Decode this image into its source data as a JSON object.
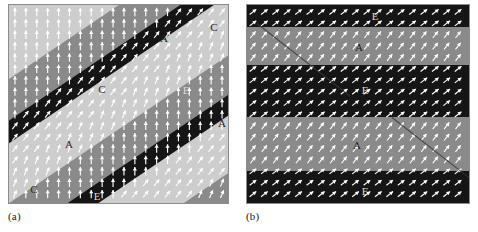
{
  "figure": {
    "type": "vector-field-domain-map",
    "background_color": "#ffffff",
    "panels": [
      {
        "id": "a",
        "caption": "(a)",
        "band_orientation": "diagonal",
        "band_angle_deg": -34,
        "arrow_color": "#ffffff",
        "frame_color": "#8c8c8c",
        "domains": [
          {
            "label": "C",
            "shade": "light",
            "color": "#cdcdcd"
          },
          {
            "label": "A",
            "shade": "mid",
            "color": "#8a8a8a"
          },
          {
            "label": "E",
            "shade": "dark",
            "color": "#151515"
          }
        ],
        "labels": [
          {
            "text": "C",
            "x": 205,
            "y": 22,
            "on": "light"
          },
          {
            "text": "A",
            "x": 155,
            "y": 33,
            "on": "mid"
          },
          {
            "text": "E",
            "x": 177,
            "y": 85,
            "on": "dark"
          },
          {
            "text": "C",
            "x": 93,
            "y": 84,
            "on": "light"
          },
          {
            "text": "A",
            "x": 213,
            "y": 118,
            "on": "mid"
          },
          {
            "text": "A",
            "x": 60,
            "y": 139,
            "on": "mid"
          },
          {
            "text": "C",
            "x": 25,
            "y": 184,
            "on": "light"
          },
          {
            "text": "E",
            "x": 88,
            "y": 191,
            "on": "dark"
          }
        ]
      },
      {
        "id": "b",
        "caption": "(b)",
        "band_orientation": "horizontal",
        "band_angle_deg": 0,
        "arrow_color": "#ffffff",
        "frame_color": "#8c8c8c",
        "domains": [
          {
            "label": "A",
            "shade": "mid",
            "color": "#8a8a8a"
          },
          {
            "label": "E",
            "shade": "dark",
            "color": "#151515"
          }
        ],
        "stripes": [
          {
            "shade": "dark",
            "top": 0,
            "height": 22
          },
          {
            "shade": "mid",
            "top": 22,
            "height": 38
          },
          {
            "shade": "dark",
            "top": 60,
            "height": 52
          },
          {
            "shade": "mid",
            "top": 112,
            "height": 54
          },
          {
            "shade": "dark",
            "top": 166,
            "height": 34
          }
        ],
        "labels": [
          {
            "text": "E",
            "x": 128,
            "y": 11,
            "on": "dark"
          },
          {
            "text": "A",
            "x": 112,
            "y": 42,
            "on": "mid"
          },
          {
            "text": "E",
            "x": 118,
            "y": 85,
            "on": "dark"
          },
          {
            "text": "A",
            "x": 110,
            "y": 140,
            "on": "mid"
          },
          {
            "text": "E",
            "x": 118,
            "y": 186,
            "on": "dark"
          }
        ]
      }
    ]
  }
}
